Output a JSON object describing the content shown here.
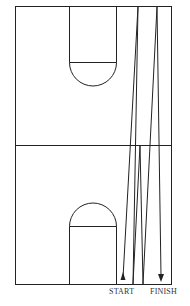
{
  "diagram": {
    "type": "basketball-court-drill",
    "labels": {
      "start": "START",
      "finish": "FINISH"
    },
    "colors": {
      "line": "#222222",
      "background": "#ffffff"
    },
    "court": {
      "x": 15,
      "y": 6,
      "width": 156,
      "height": 278,
      "midline_y": 145
    },
    "path_points": [
      [
        123,
        282
      ],
      [
        138,
        6
      ],
      [
        133,
        284
      ],
      [
        140,
        145
      ],
      [
        143,
        284
      ],
      [
        157,
        6
      ],
      [
        161,
        282
      ]
    ]
  }
}
